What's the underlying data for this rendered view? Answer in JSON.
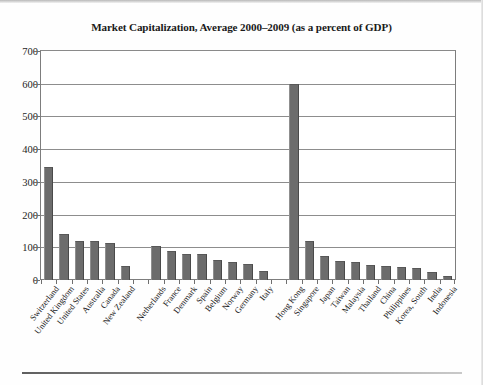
{
  "chart_data": {
    "type": "bar",
    "title": "Market Capitalization, Average 2000–2009 (as a percent of GDP)",
    "xlabel": "",
    "ylabel": "",
    "ylim": [
      0,
      700
    ],
    "ytick_step": 100,
    "yticks": [
      "700",
      "600",
      "500",
      "400",
      "300",
      "200",
      "100",
      "0"
    ],
    "grid": true,
    "legend": "none",
    "bar_color": "#6c6c6c",
    "categories": [
      "Switzerland",
      "United Kingdom",
      "United States",
      "Australia",
      "Canada",
      "New Zealand",
      "",
      "Netherlands",
      "France",
      "Denmark",
      "Spain",
      "Belgium",
      "Norway",
      "Germany",
      "Italy",
      "",
      "Hong Kong",
      "Singapore",
      "Japan",
      "Taiwan",
      "Malaysia",
      "Thailand",
      "China",
      "Philippines",
      "Korea, South",
      "India",
      "Indonesia"
    ],
    "values": [
      345,
      140,
      120,
      118,
      113,
      42,
      null,
      105,
      88,
      80,
      78,
      62,
      55,
      48,
      28,
      null,
      598,
      118,
      73,
      58,
      55,
      45,
      43,
      40,
      38,
      25,
      13
    ]
  }
}
